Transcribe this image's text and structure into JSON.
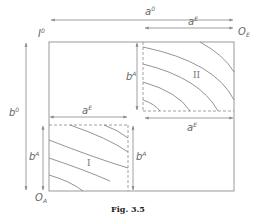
{
  "figure": {
    "caption": "Fig. 3.5",
    "labels": {
      "top_width": {
        "base": "a",
        "sup": "0"
      },
      "box2_width_top": {
        "base": "a",
        "sup": "E"
      },
      "box2_width_bottom": {
        "base": "a",
        "sup": "E"
      },
      "box1_width_top": {
        "base": "a",
        "sup": "E"
      },
      "left_height": {
        "base": "b",
        "sup": "0"
      },
      "box2_height": {
        "base": "b",
        "sup": "A"
      },
      "box1_height_left": {
        "base": "b",
        "sup": "A"
      },
      "box1_height_right": {
        "base": "b",
        "sup": "A"
      },
      "corner_top_left": {
        "base": "I",
        "sup": "0"
      },
      "origin_E": {
        "base": "O",
        "sub": "E"
      },
      "origin_A": {
        "base": "O",
        "sub": "A"
      },
      "region_I": "I",
      "region_II": "II"
    },
    "colors": {
      "line": "#888888",
      "text": "#666666"
    }
  }
}
